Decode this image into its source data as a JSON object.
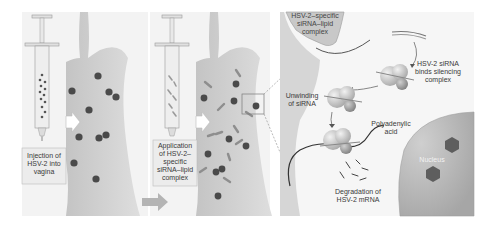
{
  "panels": {
    "panel1": {
      "label_line1": "Injection of",
      "label_line2": "HSV-2 into",
      "label_line3": "vagina"
    },
    "panel2": {
      "label_line1": "Application",
      "label_line2": "of HSV-2–",
      "label_line3": "specific",
      "label_line4": "siRNA–lipid",
      "label_line5": "complex"
    },
    "panel3": {
      "complex_line1": "HSV-2–specific",
      "complex_line2": "siRNA–lipid",
      "complex_line3": "complex",
      "binds_line1": "HSV-2 siRNA",
      "binds_line2": "binds silencing",
      "binds_line3": "complex",
      "unwinding_line1": "Unwinding",
      "unwinding_line2": "of siRNA",
      "poly_line1": "Polyadenylic",
      "poly_line2": "acid",
      "nucleus": "Nucleus",
      "degradation_line1": "Degradation of",
      "degradation_line2": "HSV-2 mRNA"
    }
  },
  "colors": {
    "tissue": "#d2d2d2",
    "tissue_dark": "#bcbcbc",
    "virus": "#4a4a4a",
    "sirna": "#8e8e8e",
    "nucleus": "#b5b5b5",
    "box_bg": "#ececec"
  }
}
